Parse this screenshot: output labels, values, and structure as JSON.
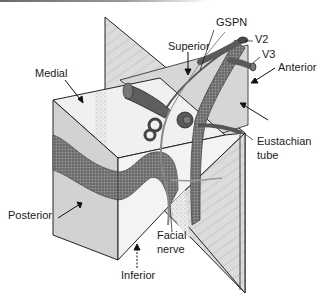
{
  "figure": {
    "labels": {
      "gspn": "GSPN",
      "v2": "V2",
      "v3": "V3",
      "superior": "Superior",
      "anterior": "Anterior",
      "medial": "Medial",
      "eustachian_line1": "Eustachian",
      "eustachian_line2": "tube",
      "posterior": "Posterior",
      "facial_line1": "Facial",
      "facial_line2": "nerve",
      "inferior": "Inferior"
    },
    "colors": {
      "background": "#ffffff",
      "plane_fill": "#d9d9d9",
      "box_top": "#efefef",
      "box_left": "#d4d4d4",
      "box_front": "#f2f2f2",
      "dark_band": "#6e6e6e",
      "structure_dark": "#5a5a5a",
      "stroke": "#1a1a1a"
    }
  }
}
